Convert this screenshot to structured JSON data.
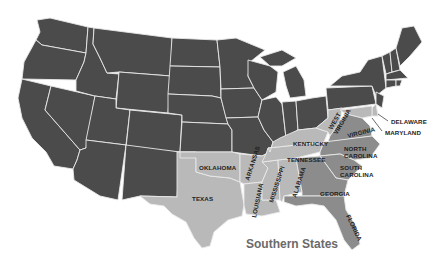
{
  "title": "Southern States",
  "colors": {
    "background": "#ffffff",
    "non_southern": "#4b4b4b",
    "southern_light": "#b9b9b9",
    "southern_medium": "#8c8c8c",
    "border": "#e9e9e9",
    "label": "#1e1e1e",
    "caption": "#6a6a6a"
  },
  "labels": {
    "texas": "TEXAS",
    "oklahoma": "OKLAHOMA",
    "arkansas": "ARKANSAS",
    "louisiana": "LOUISIANA",
    "mississippi": "MISSISSIPPI",
    "alabama": "ALABAMA",
    "tennessee": "TENNESSEE",
    "kentucky": "KENTUCKY",
    "west_virginia_1": "WEST",
    "west_virginia_2": "VIRGINIA",
    "virginia": "VIRGINIA",
    "north_carolina_1": "NORTH",
    "north_carolina_2": "CAROLINA",
    "south_carolina_1": "SOUTH",
    "south_carolina_2": "CAROLINA",
    "georgia": "GEORGIA",
    "florida": "FLORIDA",
    "delaware": "DELAWARE",
    "maryland": "MARYLAND"
  },
  "southern_states": [
    "Texas",
    "Oklahoma",
    "Arkansas",
    "Louisiana",
    "Mississippi",
    "Alabama",
    "Tennessee",
    "Kentucky",
    "West Virginia",
    "Virginia",
    "North Carolina",
    "South Carolina",
    "Georgia",
    "Florida",
    "Delaware",
    "Maryland"
  ]
}
